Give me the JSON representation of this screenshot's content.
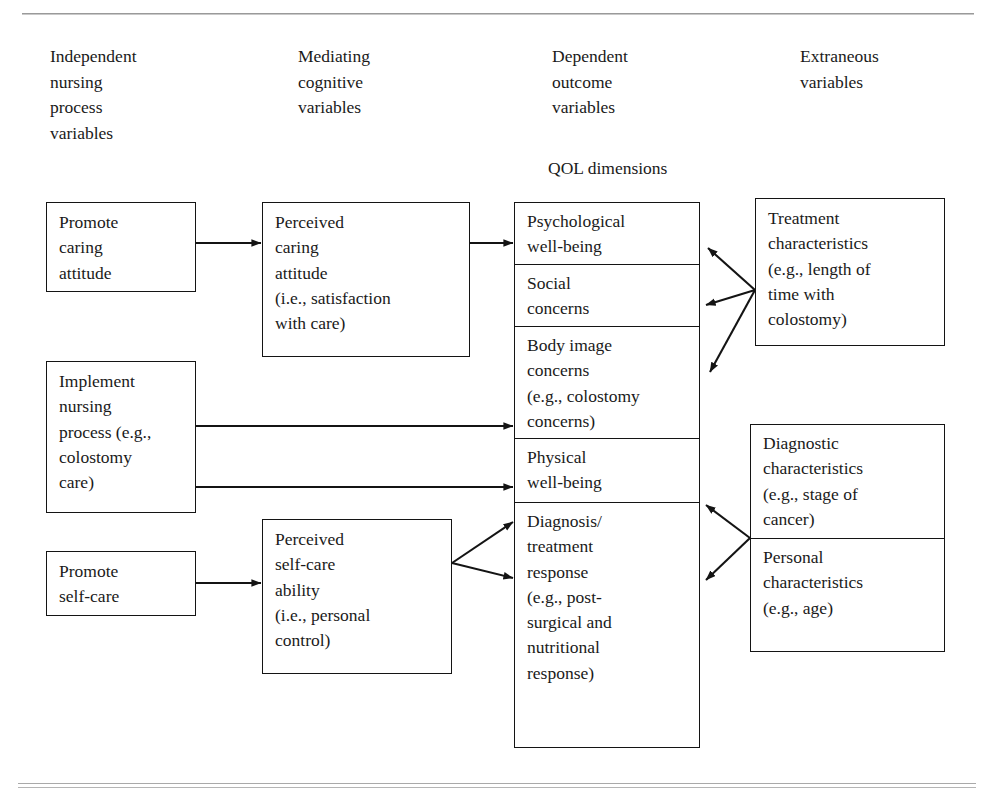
{
  "page": {
    "header_note": "",
    "qol_label": "QOL dimensions"
  },
  "columns": [
    {
      "id": "independent",
      "label": "Independent\nnursing\nprocess\nvariables"
    },
    {
      "id": "mediating",
      "label": "Mediating\ncognitive\nvariables"
    },
    {
      "id": "dependent",
      "label": "Dependent\noutcome\nvariables"
    },
    {
      "id": "extraneous",
      "label": "Extraneous\nvariables"
    }
  ],
  "independent_boxes": [
    {
      "id": "promote-caring-attitude",
      "text": "Promote\ncaring\nattitude"
    },
    {
      "id": "implement-nursing-process",
      "text": "Implement\nnursing\nprocess (e.g.,\ncolostomy\ncare)"
    },
    {
      "id": "promote-self-care",
      "text": "Promote\nself-care"
    }
  ],
  "mediating_boxes": [
    {
      "id": "perceived-caring-attitude",
      "text": "Perceived\ncaring\nattitude\n(i.e., satisfaction\nwith care)"
    },
    {
      "id": "perceived-self-care-ability",
      "text": "Perceived\nself-care\nability\n(i.e., personal\ncontrol)"
    }
  ],
  "qol_cells": [
    {
      "id": "psychological-well-being",
      "text": "Psychological\nwell-being"
    },
    {
      "id": "social-concerns",
      "text": "Social\nconcerns"
    },
    {
      "id": "body-image-concerns",
      "text": "Body image\nconcerns\n(e.g., colostomy\nconcerns)"
    },
    {
      "id": "physical-well-being",
      "text": "Physical\nwell-being"
    },
    {
      "id": "diagnosis-treatment-response",
      "text": "Diagnosis/\ntreatment\nresponse\n(e.g., post-\nsurgical and\nnutritional\nresponse)"
    }
  ],
  "extraneous_boxes": [
    {
      "id": "treatment-characteristics",
      "text": "Treatment\ncharacteristics\n(e.g., length of\ntime with\ncolostomy)"
    },
    {
      "id": "diagnostic-characteristics",
      "text": "Diagnostic\ncharacteristics\n(e.g., stage of\ncancer)"
    },
    {
      "id": "personal-characteristics",
      "text": "Personal\ncharacteristics\n(e.g., age)"
    }
  ],
  "colors": {
    "line": "#141414",
    "rule": "#a9a9a9",
    "text": "#1a1a1a",
    "background": "#ffffff"
  }
}
